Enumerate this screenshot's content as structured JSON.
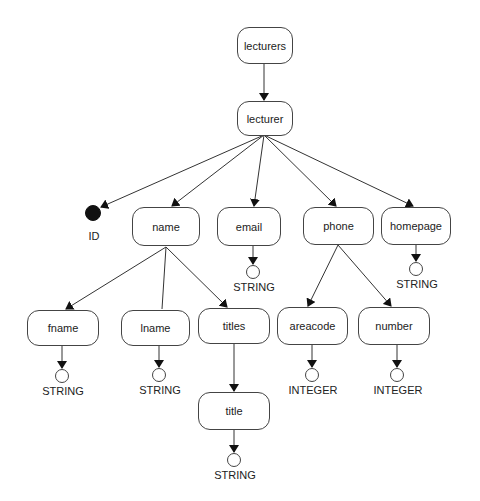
{
  "diagram": {
    "nodes": {
      "lecturers": {
        "label": "lecturers"
      },
      "lecturer": {
        "label": "lecturer"
      },
      "name": {
        "label": "name"
      },
      "email": {
        "label": "email"
      },
      "phone": {
        "label": "phone"
      },
      "homepage": {
        "label": "homepage"
      },
      "fname": {
        "label": "fname"
      },
      "lname": {
        "label": "lname"
      },
      "titles": {
        "label": "titles"
      },
      "areacode": {
        "label": "areacode"
      },
      "number": {
        "label": "number"
      },
      "title": {
        "label": "title"
      }
    },
    "terminals": {
      "id": {
        "label": "ID",
        "kind": "attribute"
      },
      "email_type": {
        "label": "STRING"
      },
      "homepage_type": {
        "label": "STRING"
      },
      "fname_type": {
        "label": "STRING"
      },
      "lname_type": {
        "label": "STRING"
      },
      "areacode_type": {
        "label": "INTEGER"
      },
      "number_type": {
        "label": "INTEGER"
      },
      "title_type": {
        "label": "STRING"
      }
    },
    "edges": [
      [
        "lecturers",
        "lecturer"
      ],
      [
        "lecturer",
        "ID"
      ],
      [
        "lecturer",
        "name"
      ],
      [
        "lecturer",
        "email"
      ],
      [
        "lecturer",
        "phone"
      ],
      [
        "lecturer",
        "homepage"
      ],
      [
        "name",
        "fname"
      ],
      [
        "name",
        "lname"
      ],
      [
        "name",
        "titles"
      ],
      [
        "phone",
        "areacode"
      ],
      [
        "phone",
        "number"
      ],
      [
        "titles",
        "title"
      ],
      [
        "email",
        "STRING"
      ],
      [
        "homepage",
        "STRING"
      ],
      [
        "fname",
        "STRING"
      ],
      [
        "lname",
        "STRING"
      ],
      [
        "areacode",
        "INTEGER"
      ],
      [
        "number",
        "INTEGER"
      ],
      [
        "title",
        "STRING"
      ]
    ]
  }
}
